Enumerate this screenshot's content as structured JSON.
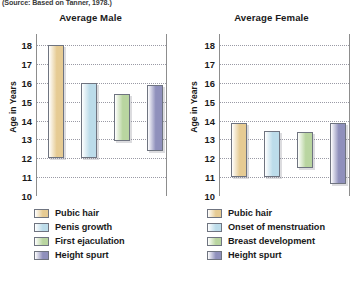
{
  "source_note": "(Source: Based on Tanner, 1978.)",
  "axis_label": "Age in Years",
  "colors": {
    "pubic_hair": "#e6cb93",
    "second": "#bcdcea",
    "third": "#b9d5a0",
    "height_spurt": "#8f90bc",
    "border": "#6f7480",
    "grid": "#9a9aa5",
    "frame": "#8d8d8d"
  },
  "chart_data": [
    {
      "type": "bar",
      "orientation": "vertical",
      "bar_style": "floating-range",
      "title": "Average Male",
      "xlabel": "",
      "ylabel": "Age in Years",
      "ylim": [
        10,
        18.6
      ],
      "yticks": [
        18,
        17,
        16,
        15,
        14,
        13,
        12,
        11,
        10
      ],
      "grid": true,
      "legend_position": "below",
      "categories": [
        "Pubic hair",
        "Penis growth",
        "First ejaculation",
        "Height spurt"
      ],
      "ranges": [
        {
          "name": "Pubic hair",
          "start": 12.0,
          "end": 18.0,
          "color": "#e6cb93"
        },
        {
          "name": "Penis growth",
          "start": 12.0,
          "end": 16.0,
          "color": "#bcdcea"
        },
        {
          "name": "First ejaculation",
          "start": 12.9,
          "end": 15.4,
          "color": "#b9d5a0"
        },
        {
          "name": "Height spurt",
          "start": 12.4,
          "end": 15.9,
          "color": "#8f90bc"
        }
      ]
    },
    {
      "type": "bar",
      "orientation": "vertical",
      "bar_style": "floating-range",
      "title": "Average Female",
      "xlabel": "",
      "ylabel": "Age in Years",
      "ylim": [
        10,
        18.6
      ],
      "yticks": [
        18,
        17,
        16,
        15,
        14,
        13,
        12,
        11,
        10
      ],
      "grid": true,
      "legend_position": "below",
      "categories": [
        "Pubic hair",
        "Onset of menstruation",
        "Breast development",
        "Height spurt"
      ],
      "ranges": [
        {
          "name": "Pubic hair",
          "start": 11.0,
          "end": 13.9,
          "color": "#e6cb93"
        },
        {
          "name": "Onset of menstruation",
          "start": 11.0,
          "end": 13.45,
          "color": "#bcdcea"
        },
        {
          "name": "Breast development",
          "start": 11.5,
          "end": 13.4,
          "color": "#b9d5a0"
        },
        {
          "name": "Height spurt",
          "start": 10.65,
          "end": 13.9,
          "color": "#8f90bc"
        }
      ]
    }
  ]
}
